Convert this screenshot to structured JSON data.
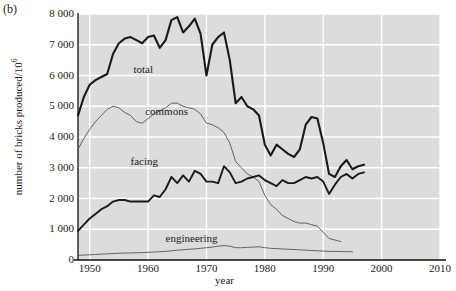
{
  "figure": {
    "panel_label": "(b)",
    "xlabel": "year",
    "ylabel_text": "number of bricks produced/10",
    "ylabel_exponent": "6"
  },
  "chart_data": {
    "type": "line",
    "title": "",
    "xlabel": "year",
    "ylabel": "number of bricks produced/10^6",
    "xlim": [
      1948,
      2010
    ],
    "ylim": [
      0,
      8000
    ],
    "xticks": [
      1950,
      1960,
      1970,
      1980,
      1990,
      2000,
      2010
    ],
    "yticks": [
      0,
      1000,
      2000,
      3000,
      4000,
      5000,
      6000,
      7000,
      8000
    ],
    "grid": true,
    "grid_color": "#ffffff",
    "plot_background": "#dcdcdc",
    "legend": "inline-annotations",
    "series": [
      {
        "name": "total",
        "label": "total",
        "color": "#1a1a1a",
        "width": 2.1,
        "label_x": 1957.5,
        "label_y": 6180,
        "x": [
          1948,
          1949,
          1950,
          1951,
          1952,
          1953,
          1954,
          1955,
          1956,
          1957,
          1958,
          1959,
          1960,
          1961,
          1962,
          1963,
          1964,
          1965,
          1966,
          1967,
          1968,
          1969,
          1970,
          1971,
          1972,
          1973,
          1974,
          1975,
          1976,
          1977,
          1978,
          1979,
          1980,
          1981,
          1982,
          1983,
          1984,
          1985,
          1986,
          1987,
          1988,
          1989,
          1990,
          1991,
          1992,
          1993,
          1994,
          1995,
          1996,
          1997
        ],
        "y": [
          4700,
          5300,
          5700,
          5850,
          5950,
          6050,
          6700,
          7050,
          7200,
          7250,
          7150,
          7050,
          7250,
          7300,
          6900,
          7150,
          7800,
          7900,
          7400,
          7600,
          7850,
          7350,
          6000,
          7000,
          7250,
          7400,
          6500,
          5100,
          5300,
          5000,
          4900,
          4700,
          3750,
          3400,
          3750,
          3600,
          3450,
          3350,
          3600,
          4400,
          4650,
          4600,
          3800,
          2800,
          2700,
          3050,
          3250,
          2950,
          3050,
          3100
        ]
      },
      {
        "name": "commons",
        "label": "commons",
        "color": "#555555",
        "width": 0.9,
        "label_x": 1959.5,
        "label_y": 4820,
        "x": [
          1948,
          1949,
          1950,
          1951,
          1952,
          1953,
          1954,
          1955,
          1956,
          1957,
          1958,
          1959,
          1960,
          1961,
          1962,
          1963,
          1964,
          1965,
          1966,
          1967,
          1968,
          1969,
          1970,
          1971,
          1972,
          1973,
          1974,
          1975,
          1976,
          1977,
          1978,
          1979,
          1980,
          1981,
          1982,
          1983,
          1984,
          1985,
          1986,
          1987,
          1988,
          1989,
          1990,
          1991,
          1992,
          1993
        ],
        "y": [
          3600,
          3950,
          4250,
          4500,
          4700,
          4900,
          5000,
          4950,
          4800,
          4700,
          4500,
          4450,
          4600,
          4750,
          4850,
          4950,
          5100,
          5100,
          5000,
          4950,
          4900,
          4750,
          4450,
          4400,
          4300,
          4150,
          3800,
          3200,
          3000,
          2800,
          2700,
          2550,
          2100,
          1800,
          1650,
          1450,
          1350,
          1250,
          1200,
          1200,
          1150,
          1100,
          900,
          700,
          650,
          600
        ]
      },
      {
        "name": "facing",
        "label": "facing",
        "color": "#1a1a1a",
        "width": 1.9,
        "label_x": 1957.0,
        "label_y": 3200,
        "x": [
          1948,
          1949,
          1950,
          1951,
          1952,
          1953,
          1954,
          1955,
          1956,
          1957,
          1958,
          1959,
          1960,
          1961,
          1962,
          1963,
          1964,
          1965,
          1966,
          1967,
          1968,
          1969,
          1970,
          1971,
          1972,
          1973,
          1974,
          1975,
          1976,
          1977,
          1978,
          1979,
          1980,
          1981,
          1982,
          1983,
          1984,
          1985,
          1986,
          1987,
          1988,
          1989,
          1990,
          1991,
          1992,
          1993,
          1994,
          1995,
          1996,
          1997
        ],
        "y": [
          950,
          1150,
          1350,
          1500,
          1650,
          1750,
          1900,
          1950,
          1950,
          1900,
          1900,
          1900,
          1900,
          2100,
          2050,
          2300,
          2700,
          2500,
          2750,
          2550,
          2900,
          2800,
          2550,
          2550,
          2500,
          3050,
          2850,
          2500,
          2550,
          2650,
          2700,
          2750,
          2600,
          2500,
          2400,
          2600,
          2500,
          2500,
          2600,
          2700,
          2650,
          2700,
          2550,
          2150,
          2450,
          2700,
          2800,
          2650,
          2800,
          2850
        ]
      },
      {
        "name": "engineering",
        "label": "engineering",
        "color": "#555555",
        "width": 0.9,
        "label_x": 1963.0,
        "label_y": 680,
        "x": [
          1948,
          1949,
          1950,
          1951,
          1952,
          1953,
          1954,
          1955,
          1956,
          1957,
          1958,
          1959,
          1960,
          1961,
          1962,
          1963,
          1964,
          1965,
          1966,
          1967,
          1968,
          1969,
          1970,
          1971,
          1972,
          1973,
          1974,
          1975,
          1976,
          1977,
          1978,
          1979,
          1980,
          1981,
          1982,
          1983,
          1984,
          1985,
          1986,
          1987,
          1988,
          1989,
          1990,
          1991,
          1992,
          1993,
          1994,
          1995
        ],
        "y": [
          150,
          160,
          170,
          180,
          190,
          200,
          210,
          220,
          225,
          230,
          235,
          240,
          250,
          260,
          270,
          280,
          300,
          320,
          330,
          350,
          360,
          380,
          400,
          420,
          450,
          470,
          450,
          400,
          400,
          410,
          420,
          430,
          400,
          380,
          370,
          360,
          350,
          340,
          330,
          320,
          310,
          300,
          290,
          280,
          280,
          275,
          270,
          270
        ]
      }
    ]
  },
  "axis": {
    "ytick_labels": [
      "0",
      "1 000",
      "2 000",
      "3 000",
      "4 000",
      "5 000",
      "6 000",
      "7 000",
      "8 000"
    ],
    "xtick_labels": [
      "1950",
      "1960",
      "1970",
      "1980",
      "1990",
      "2000",
      "2010"
    ]
  }
}
